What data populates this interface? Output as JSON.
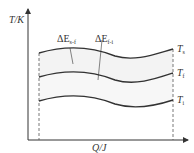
{
  "diagram": {
    "y_axis_label": "T/K",
    "x_axis_label": "Q/J",
    "curves": [
      {
        "name": "T",
        "sub": "s"
      },
      {
        "name": "T",
        "sub": "f"
      },
      {
        "name": "T",
        "sub": "i"
      }
    ],
    "annotations": [
      {
        "prefix": "ΔE",
        "sub": "s-f"
      },
      {
        "prefix": "ΔE",
        "sub": "f-i"
      }
    ],
    "colors": {
      "line": "#333333",
      "fill": "#f2f2f2"
    }
  }
}
